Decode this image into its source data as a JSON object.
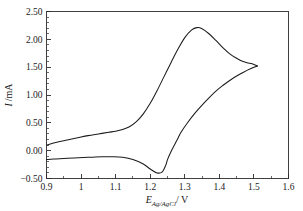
{
  "figure": {
    "caption": "",
    "background_color": "#ffffff",
    "curve_color": "#1b1b1b",
    "axis_color": "#2b2b2b"
  },
  "axes": {
    "x_title_symbol": "E",
    "x_title_subscript": "Ag/AgCl",
    "x_title_unit": "/ V",
    "y_title_symbol": "I",
    "y_title_unit": "/mA",
    "x_ticks": [
      "0.9",
      "1",
      "1.1",
      "1.2",
      "1.3",
      "1.4",
      "1.5",
      "1.6"
    ],
    "y_ticks": [
      "2.50",
      "2.00",
      "1.50",
      "1.00",
      "0.50",
      "0.00",
      "-0.50"
    ]
  },
  "chart_data": {
    "type": "line",
    "title": "",
    "xlabel": "E_Ag/AgCl / V",
    "ylabel": "I /mA",
    "xlim": [
      0.9,
      1.6
    ],
    "ylim": [
      -0.5,
      2.5
    ],
    "xticks": [
      0.9,
      1.0,
      1.1,
      1.2,
      1.3,
      1.4,
      1.5,
      1.6
    ],
    "yticks": [
      -0.5,
      0.0,
      0.5,
      1.0,
      1.5,
      2.0,
      2.5
    ],
    "x_minor_tick_step": 0.05,
    "y_minor_tick_step": 0.1,
    "grid": false,
    "legend": null,
    "annotations": [
      {
        "label": "anodic peak",
        "x": 1.33,
        "y": 2.21
      },
      {
        "label": "cathodic trough",
        "x": 1.24,
        "y": -0.4
      },
      {
        "label": "switching potential",
        "x": 1.51,
        "y": 1.52
      }
    ],
    "series": [
      {
        "name": "forward (anodic) scan",
        "x": [
          0.9,
          0.93,
          0.96,
          0.99,
          1.02,
          1.05,
          1.08,
          1.1,
          1.12,
          1.14,
          1.16,
          1.18,
          1.2,
          1.22,
          1.24,
          1.26,
          1.28,
          1.3,
          1.32,
          1.335,
          1.35,
          1.37,
          1.39,
          1.41,
          1.43,
          1.45,
          1.465,
          1.48,
          1.495,
          1.51
        ],
        "y": [
          0.1,
          0.15,
          0.19,
          0.23,
          0.27,
          0.3,
          0.33,
          0.35,
          0.38,
          0.43,
          0.52,
          0.66,
          0.85,
          1.08,
          1.33,
          1.58,
          1.82,
          2.03,
          2.17,
          2.21,
          2.19,
          2.1,
          1.98,
          1.85,
          1.74,
          1.66,
          1.61,
          1.58,
          1.56,
          1.52
        ]
      },
      {
        "name": "reverse (cathodic) scan",
        "x": [
          1.51,
          1.49,
          1.47,
          1.45,
          1.43,
          1.41,
          1.39,
          1.37,
          1.35,
          1.33,
          1.31,
          1.29,
          1.28,
          1.27,
          1.26,
          1.25,
          1.245,
          1.235,
          1.22,
          1.2,
          1.18,
          1.15,
          1.12,
          1.09,
          1.06,
          1.02,
          0.98,
          0.95,
          0.92,
          0.9
        ],
        "y": [
          1.52,
          1.47,
          1.41,
          1.34,
          1.26,
          1.17,
          1.07,
          0.95,
          0.82,
          0.68,
          0.52,
          0.34,
          0.22,
          0.1,
          -0.02,
          -0.16,
          -0.26,
          -0.38,
          -0.4,
          -0.33,
          -0.24,
          -0.16,
          -0.12,
          -0.11,
          -0.11,
          -0.12,
          -0.13,
          -0.14,
          -0.15,
          -0.16
        ]
      }
    ]
  }
}
